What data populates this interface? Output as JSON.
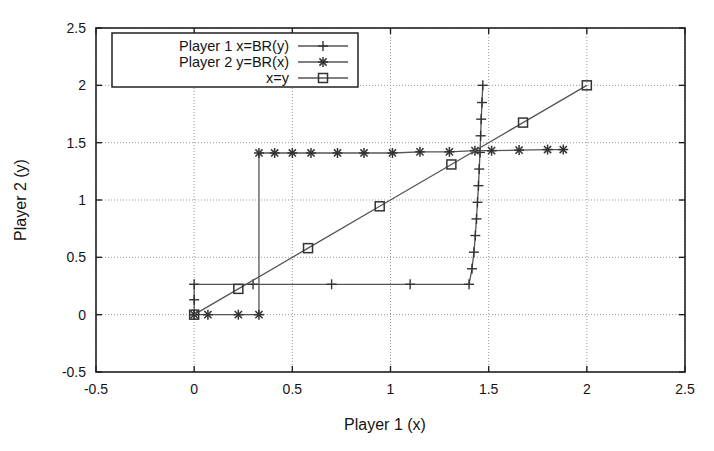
{
  "chart_data": {
    "type": "line",
    "title": "",
    "xlabel": "Player 1 (x)",
    "ylabel": "Player 2 (y)",
    "xlim": [
      -0.5,
      2.5
    ],
    "ylim": [
      -0.5,
      2.5
    ],
    "xticks": [
      "-0.5",
      "0",
      "0.5",
      "1",
      "1.5",
      "2",
      "2.5"
    ],
    "xtick_values": [
      -0.5,
      0,
      0.5,
      1,
      1.5,
      2,
      2.5
    ],
    "yticks": [
      "-0.5",
      "0",
      "0.5",
      "1",
      "1.5",
      "2",
      "2.5"
    ],
    "ytick_values": [
      -0.5,
      0,
      0.5,
      1,
      1.5,
      2,
      2.5
    ],
    "grid": true,
    "grid_style": "dotted",
    "legend_position": "top-left",
    "line_color": "#555555",
    "marker_color": "#333333",
    "axis_color": "#222222",
    "grid_color": "#999999",
    "background": "#ffffff",
    "series": [
      {
        "name": "Player 1 x=BR(y)",
        "marker": "plus",
        "points": [
          [
            0.0,
            0.0
          ],
          [
            0.0,
            0.13
          ],
          [
            0.0,
            0.265
          ],
          [
            0.3,
            0.265
          ],
          [
            0.7,
            0.265
          ],
          [
            1.1,
            0.265
          ],
          [
            1.4,
            0.265
          ],
          [
            1.415,
            0.4
          ],
          [
            1.425,
            0.545
          ],
          [
            1.432,
            0.69
          ],
          [
            1.438,
            0.835
          ],
          [
            1.443,
            0.98
          ],
          [
            1.448,
            1.125
          ],
          [
            1.452,
            1.27
          ],
          [
            1.456,
            1.415
          ],
          [
            1.459,
            1.56
          ],
          [
            1.462,
            1.705
          ],
          [
            1.466,
            1.85
          ],
          [
            1.47,
            2.0
          ]
        ]
      },
      {
        "name": "Player 2 y=BR(x)",
        "marker": "asterisk",
        "points": [
          [
            0.0,
            0.0
          ],
          [
            0.07,
            0.0
          ],
          [
            0.225,
            0.0
          ],
          [
            0.33,
            0.0
          ],
          [
            0.33,
            1.41
          ],
          [
            0.41,
            1.41
          ],
          [
            0.5,
            1.41
          ],
          [
            0.595,
            1.41
          ],
          [
            0.73,
            1.41
          ],
          [
            0.865,
            1.41
          ],
          [
            1.01,
            1.41
          ],
          [
            1.15,
            1.42
          ],
          [
            1.3,
            1.42
          ],
          [
            1.43,
            1.43
          ],
          [
            1.515,
            1.43
          ],
          [
            1.655,
            1.435
          ],
          [
            1.8,
            1.44
          ],
          [
            1.88,
            1.44
          ]
        ]
      },
      {
        "name": "x=y",
        "marker": "square",
        "points": [
          [
            0.0,
            0.0
          ],
          [
            0.225,
            0.225
          ],
          [
            0.58,
            0.58
          ],
          [
            0.945,
            0.945
          ],
          [
            1.31,
            1.31
          ],
          [
            1.675,
            1.675
          ],
          [
            2.0,
            2.0
          ]
        ]
      }
    ],
    "annotations": [],
    "intersection_note": ""
  },
  "legend": {
    "entries": [
      {
        "label": "Player 1 x=BR(y)",
        "marker": "plus"
      },
      {
        "label": "Player 2 y=BR(x)",
        "marker": "asterisk"
      },
      {
        "label": "x=y",
        "marker": "square"
      }
    ]
  }
}
